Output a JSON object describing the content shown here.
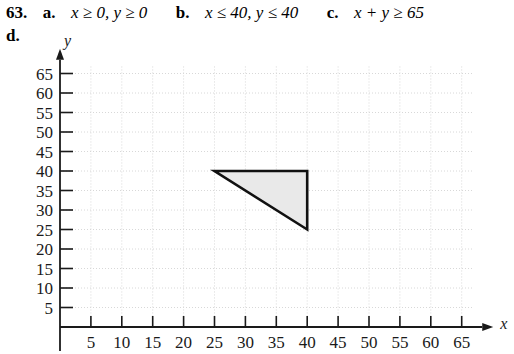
{
  "exercise": {
    "number": "63.",
    "parts": [
      {
        "letter": "a.",
        "expression": "x ≥ 0, y ≥ 0"
      },
      {
        "letter": "b.",
        "expression": "x ≤ 40, y ≤ 40"
      },
      {
        "letter": "c.",
        "expression": "x + y ≥ 65"
      }
    ],
    "part_d_letter": "d."
  },
  "chart_data": {
    "type": "area",
    "title": "",
    "xlabel": "x",
    "ylabel": "y",
    "xlim": [
      0,
      68
    ],
    "ylim": [
      0,
      68
    ],
    "xticks": [
      5,
      10,
      15,
      20,
      25,
      30,
      35,
      40,
      45,
      50,
      55,
      60,
      65
    ],
    "yticks": [
      5,
      10,
      15,
      20,
      25,
      30,
      35,
      40,
      45,
      50,
      55,
      60,
      65
    ],
    "xtick_labels": [
      "5",
      "10",
      "15",
      "20",
      "25",
      "30",
      "35",
      "40",
      "45",
      "50",
      "55",
      "60",
      "65"
    ],
    "ytick_labels": [
      "5",
      "10",
      "15",
      "20",
      "25",
      "30",
      "35",
      "40",
      "45",
      "50",
      "55",
      "60",
      "65"
    ],
    "grid": true,
    "grid_style": "dotted",
    "legend": null,
    "annotations": [],
    "regions": [
      {
        "name": "feasible-region",
        "label": "",
        "vertices": [
          [
            25,
            40
          ],
          [
            40,
            40
          ],
          [
            40,
            25
          ]
        ],
        "fill": "#e9e9e9",
        "stroke": "#111111",
        "stroke_width": 2.6,
        "closed": true,
        "description": "Triangular feasible region bounded by x + y ≥ 65, x ≤ 40, y ≤ 40"
      }
    ]
  },
  "colors": {
    "axis": "#1a1a1a",
    "grid": "#d8d8d8",
    "region_fill": "#e9e9e9",
    "region_stroke": "#111111",
    "text": "#000000",
    "background": "#ffffff"
  }
}
